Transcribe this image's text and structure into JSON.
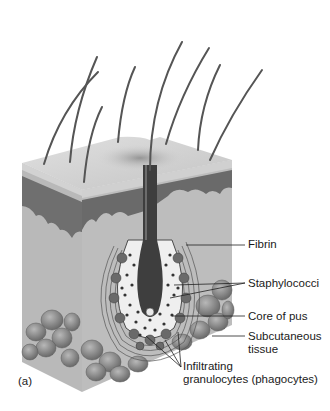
{
  "figure": {
    "panel_label": "(a)",
    "labels": [
      {
        "id": "fibrin",
        "text": "Fibrin"
      },
      {
        "id": "staphylococci",
        "text": "Staphylococci"
      },
      {
        "id": "core-of-pus",
        "text": "Core of pus"
      },
      {
        "id": "subcutaneous-tissue",
        "line1": "Subcutaneous",
        "line2": "tissue"
      },
      {
        "id": "infiltrating-granulocytes",
        "line1": "Infiltrating",
        "line2": "granulocytes (phagocytes)"
      }
    ],
    "colors": {
      "epidermis": "#c9c9c9",
      "dermis_dark": "#6e6e6e",
      "dermis": "#b5b5b5",
      "fat_cells": "#8a8a8a",
      "hair": "#5a5a5a",
      "pus": "#f2f2f2",
      "bacteria": "#3c3c3c"
    }
  }
}
